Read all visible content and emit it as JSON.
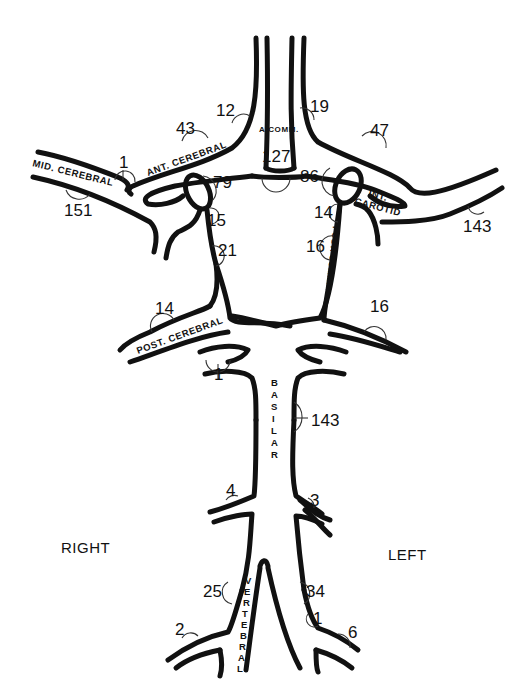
{
  "diagram": {
    "orientation": {
      "right_label": "RIGHT",
      "left_label": "LEFT"
    },
    "vessel_labels": {
      "mid_cerebral": "MID. CEREBRAL",
      "ant_cerebral": "ANT. CEREBRAL",
      "a_comm": "A.COMM.",
      "int_carotid": "INT.",
      "int_carotid_2": "CAROTID",
      "post_comm": "POST. COMM.",
      "post_cerebral": "POST. CEREBRAL",
      "basilar": [
        "B",
        "A",
        "S",
        "I",
        "L",
        "A",
        "R"
      ],
      "vertebral": [
        "V",
        "E",
        "R",
        "T",
        "E",
        "B",
        "R",
        "A",
        "L"
      ]
    },
    "values": {
      "r_mid_cerebral_branch": "1",
      "r_mid_cerebral": "151",
      "r_ant_cerebral": "43",
      "r_ant_cerebral_distal": "12",
      "a_comm": "127",
      "l_ant_cerebral_distal": "19",
      "l_ant_cerebral": "47",
      "r_carotid_top": "79",
      "r_carotid_low": "15",
      "r_post_comm": "21",
      "l_carotid_top": "86",
      "l_carotid_low": "14",
      "l_post_comm": "16",
      "l_mid_cerebral": "143",
      "r_post_cerebral": "14",
      "l_post_cerebral": "16",
      "r_sup_cerebellar": "1",
      "basilar": "143",
      "r_aica": "4",
      "l_aica": "3",
      "r_vertebral": "25",
      "l_vertebral": "34",
      "r_pica": "2",
      "l_pica_branch": "1",
      "l_pica": "6"
    }
  }
}
